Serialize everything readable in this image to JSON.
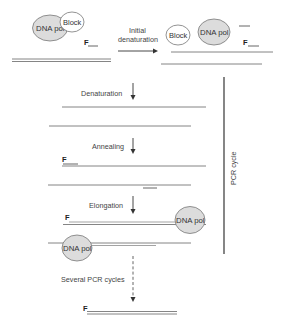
{
  "diagram": {
    "type": "PCR hot-start process diagram",
    "labels": {
      "dna_pol": "DNA pol",
      "block": "Block",
      "primer": "F",
      "initial_denaturation_line1": "Initial",
      "initial_denaturation_line2": "denaturation",
      "denaturation": "Denaturation",
      "annealing": "Annealing",
      "elongation": "Elongation",
      "several_cycles": "Several PCR cycles",
      "pcr_cycle": "PCR cycle"
    },
    "stages": [
      {
        "name": "Start",
        "elements": [
          "DNA pol bound to Block",
          "Primer F",
          "Double-stranded template DNA"
        ]
      },
      {
        "name": "Initial denaturation",
        "elements": [
          "Block released",
          "DNA pol free",
          "Primer F",
          "Separated template strands"
        ]
      },
      {
        "name": "Denaturation",
        "elements": [
          "Two single strands"
        ]
      },
      {
        "name": "Annealing",
        "elements": [
          "Primer F annealed to top strand",
          "Reverse primer annealed to bottom strand"
        ]
      },
      {
        "name": "Elongation",
        "elements": [
          "DNA pol extending F primer",
          "DNA pol extending reverse primer"
        ]
      },
      {
        "name": "Several PCR cycles",
        "elements": [
          "Amplified double-stranded product with F"
        ]
      }
    ],
    "colors": {
      "polymerase_fill": "#dcdcdc",
      "block_fill": "#ffffff",
      "strand": "#777777",
      "text": "#444444"
    }
  }
}
